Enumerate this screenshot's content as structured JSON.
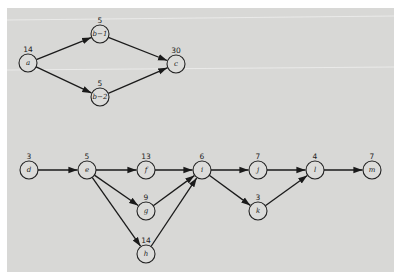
{
  "diagram": {
    "type": "activity-network",
    "node_radius": 9,
    "nodes": [
      {
        "id": "a",
        "label": "a",
        "duration": "14",
        "x": 28,
        "y": 63
      },
      {
        "id": "b1",
        "label": "b−1",
        "duration": "5",
        "x": 100,
        "y": 34
      },
      {
        "id": "b2",
        "label": "b−2",
        "duration": "5",
        "x": 100,
        "y": 97
      },
      {
        "id": "c",
        "label": "c",
        "duration": "30",
        "x": 176,
        "y": 64
      },
      {
        "id": "d",
        "label": "d",
        "duration": "3",
        "x": 29,
        "y": 170
      },
      {
        "id": "e",
        "label": "e",
        "duration": "5",
        "x": 87,
        "y": 170
      },
      {
        "id": "f",
        "label": "f",
        "duration": "13",
        "x": 146,
        "y": 170
      },
      {
        "id": "g",
        "label": "g",
        "duration": "9",
        "x": 146,
        "y": 211
      },
      {
        "id": "h",
        "label": "h",
        "duration": "14",
        "x": 146,
        "y": 254
      },
      {
        "id": "i",
        "label": "i",
        "duration": "6",
        "x": 202,
        "y": 170
      },
      {
        "id": "j",
        "label": "j",
        "duration": "7",
        "x": 258,
        "y": 170
      },
      {
        "id": "k",
        "label": "k",
        "duration": "3",
        "x": 258,
        "y": 211
      },
      {
        "id": "l",
        "label": "l",
        "duration": "4",
        "x": 315,
        "y": 170
      },
      {
        "id": "m",
        "label": "m",
        "duration": "7",
        "x": 372,
        "y": 170
      }
    ],
    "edges": [
      {
        "from": "a",
        "to": "b1"
      },
      {
        "from": "a",
        "to": "b2"
      },
      {
        "from": "b1",
        "to": "c"
      },
      {
        "from": "b2",
        "to": "c"
      },
      {
        "from": "d",
        "to": "e"
      },
      {
        "from": "e",
        "to": "f"
      },
      {
        "from": "e",
        "to": "g"
      },
      {
        "from": "e",
        "to": "h"
      },
      {
        "from": "f",
        "to": "i"
      },
      {
        "from": "g",
        "to": "i"
      },
      {
        "from": "h",
        "to": "i"
      },
      {
        "from": "i",
        "to": "j"
      },
      {
        "from": "i",
        "to": "k"
      },
      {
        "from": "j",
        "to": "l"
      },
      {
        "from": "k",
        "to": "l"
      },
      {
        "from": "l",
        "to": "m"
      }
    ]
  }
}
